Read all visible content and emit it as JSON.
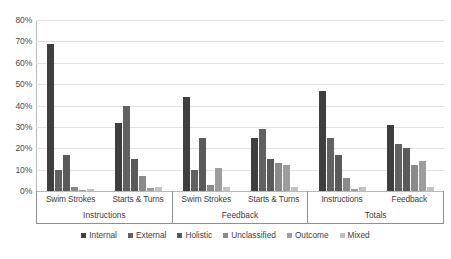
{
  "chart_data": {
    "type": "bar",
    "title": "",
    "subtitle": "",
    "xlabel": "",
    "ylabel": "",
    "ylim": [
      0,
      80
    ],
    "ytick_labels": [
      "0%",
      "10%",
      "20%",
      "30%",
      "40%",
      "50%",
      "60%",
      "70%",
      "80%"
    ],
    "ytick_values": [
      0,
      10,
      20,
      30,
      40,
      50,
      60,
      70,
      80
    ],
    "grid": true,
    "legend_position": "bottom",
    "categories": [
      "Swim Strokes",
      "Starts & Turns",
      "Swim Strokes",
      "Starts & Turns",
      "Instructions",
      "Feedback"
    ],
    "category_groups": [
      {
        "label": "Instructions",
        "subcategories": [
          "Swim Strokes",
          "Starts & Turns"
        ]
      },
      {
        "label": "Feedback",
        "subcategories": [
          "Swim Strokes",
          "Starts & Turns"
        ]
      },
      {
        "label": "Totals",
        "subcategories": [
          "Instructions",
          "Feedback"
        ]
      }
    ],
    "series": [
      {
        "name": "Internal",
        "color": "#3f3f3f",
        "values": [
          69,
          32,
          44,
          25,
          47,
          31
        ]
      },
      {
        "name": "External",
        "color": "#616161",
        "values": [
          10,
          40,
          10,
          29,
          25,
          22
        ]
      },
      {
        "name": "Holistic",
        "color": "#5a5a5a",
        "values": [
          17,
          15,
          25,
          15,
          17,
          20
        ]
      },
      {
        "name": "Unclassified",
        "color": "#8a8a8a",
        "values": [
          2,
          7,
          3,
          13,
          6,
          12
        ]
      },
      {
        "name": "Outcome",
        "color": "#9d9d9d",
        "values": [
          0.5,
          1.5,
          11,
          12,
          1,
          14
        ]
      },
      {
        "name": "Mixed",
        "color": "#c2c2c2",
        "values": [
          1,
          2,
          2,
          2,
          2,
          2
        ]
      }
    ]
  },
  "legend": {
    "items": [
      {
        "label": "Internal"
      },
      {
        "label": "External"
      },
      {
        "label": "Holistic"
      },
      {
        "label": "Unclassified"
      },
      {
        "label": "Outcome"
      },
      {
        "label": "Mixed"
      }
    ]
  }
}
